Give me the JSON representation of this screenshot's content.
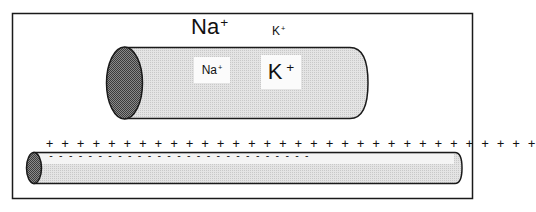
{
  "diagram": {
    "title": "",
    "colors": {
      "frame_stroke": "#1a1a1a",
      "cylinder_body_fill": "#dcdcdc",
      "cylinder_end_fill": "#6e6e6e",
      "label_box_fill": "#fbfbfb",
      "text": "#111111"
    },
    "large_axon": {
      "label": "Large-diameter axon segment",
      "outside_labels": [
        {
          "ion": "Na",
          "charge": "+",
          "size": "large"
        },
        {
          "ion": "K",
          "charge": "+",
          "size": "small"
        }
      ],
      "inside_labels": [
        {
          "ion": "Na",
          "charge": "+",
          "size": "small"
        },
        {
          "ion": "K",
          "charge": "+",
          "size": "large"
        }
      ]
    },
    "thin_axon": {
      "label": "Thin axon segment with membrane polarity",
      "outside_charge_symbol": "+",
      "outside_charge_count": 32,
      "inside_charge_symbol": "-",
      "inside_charge_count": 27,
      "outside_charges_text": "+ + + + + + + + + + + + + + + + + + + + + + + + + + + + + + + +",
      "inside_charges_text": "-   -   -   -   -   -   -   -   -   -   -   -   -   -   -   -   -   -   -   -   -   -   -   -   -   -   -"
    }
  }
}
